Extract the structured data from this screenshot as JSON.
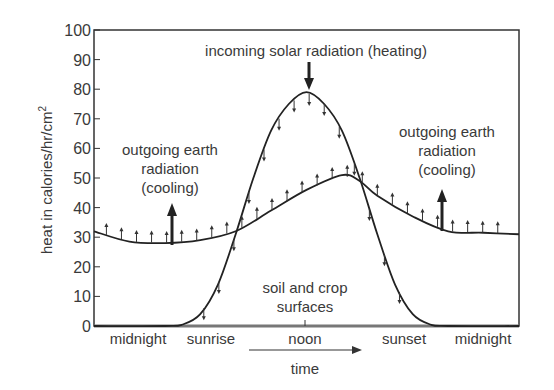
{
  "chart_data": {
    "type": "line",
    "title": "",
    "xlabel": "time",
    "ylabel": "heat in calories/hr/cm²",
    "ylim": [
      0,
      100
    ],
    "yticks": [
      0,
      10,
      20,
      30,
      40,
      50,
      60,
      70,
      80,
      90,
      100
    ],
    "xtick_labels": [
      "midnight",
      "sunrise",
      "noon",
      "sunset",
      "midnight"
    ],
    "x_hours": [
      0,
      6,
      12,
      18,
      24
    ],
    "grid": false,
    "series": [
      {
        "name": "incoming solar radiation (heating)",
        "x": [
          0,
          4,
          5,
          6,
          7,
          8,
          9,
          10,
          11,
          12,
          13,
          14,
          15,
          16,
          17,
          18,
          19,
          20,
          24
        ],
        "values": [
          0,
          0,
          0.5,
          4,
          14,
          31,
          50,
          66,
          75,
          79,
          75,
          66,
          50,
          31,
          14,
          4,
          0.5,
          0,
          0
        ]
      },
      {
        "name": "soil and crop surfaces (outgoing earth radiation)",
        "x": [
          0,
          2,
          4,
          6,
          8,
          10,
          12,
          14,
          15,
          16,
          18,
          20,
          22,
          24
        ],
        "values": [
          32,
          28.5,
          28,
          29,
          32,
          39,
          46,
          51,
          49,
          44,
          37,
          32,
          31.5,
          31
        ]
      }
    ],
    "annotations": [
      "incoming solar radiation (heating)",
      "outgoing earth radiation (cooling)",
      "outgoing earth radiation (cooling)",
      "soil and crop surfaces"
    ]
  },
  "labels": {
    "ylabel": "heat in calories/hr/cm",
    "ylabel_sup": "2",
    "incoming": "incoming solar radiation (heating)",
    "outgoing_left": [
      "outgoing earth",
      "radiation",
      "(cooling)"
    ],
    "outgoing_right": [
      "outgoing earth",
      "radiation",
      "(cooling)"
    ],
    "surfaces": [
      "soil and crop",
      "surfaces"
    ],
    "xticks": [
      "midnight",
      "sunrise",
      "noon",
      "sunset",
      "midnight"
    ],
    "xlabel": "time",
    "yticks": [
      "0",
      "10",
      "20",
      "30",
      "40",
      "50",
      "60",
      "70",
      "80",
      "90",
      "100"
    ]
  }
}
